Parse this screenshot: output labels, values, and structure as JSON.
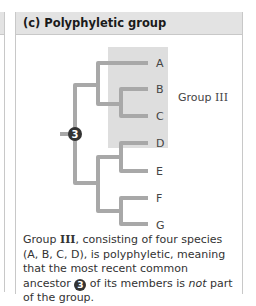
{
  "panel": {
    "title": "(c) Polyphyletic group"
  },
  "tree": {
    "leaves": [
      "A",
      "B",
      "C",
      "D",
      "E",
      "F",
      "G"
    ],
    "ancestor_node_label": "3",
    "group_label_prefix": "Group ",
    "group_label_roman": "III",
    "highlighted_leaves": [
      "A",
      "B",
      "C",
      "D"
    ],
    "colors": {
      "branch": "#a8a8a8",
      "highlight": "#dedede",
      "node": "#333333"
    }
  },
  "caption": {
    "part1": "Group ",
    "roman": "III",
    "part2": ", consisting of four species (A, B, C, D), is polyphyletic, meaning that the most recent common ancestor ",
    "node_label": "3",
    "part3": " of its members is ",
    "emphasis": "not",
    "part4": " part of the group."
  }
}
